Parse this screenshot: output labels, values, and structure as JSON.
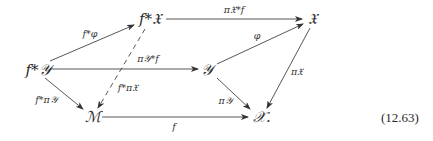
{
  "diagram": {
    "type": "commutative-diagram",
    "equation_number": "(12.63)",
    "nodes": [
      {
        "id": "fY",
        "label": "f*𝒴"
      },
      {
        "id": "fX",
        "label": "f*𝔛"
      },
      {
        "id": "X",
        "label": "𝔛"
      },
      {
        "id": "Y",
        "label": "𝒴"
      },
      {
        "id": "M",
        "label": "ℳ"
      },
      {
        "id": "Xbase",
        "label": "𝒳."
      }
    ],
    "edges": [
      {
        "from": "fY",
        "to": "fX",
        "label": "f*φ",
        "style": "solid"
      },
      {
        "from": "fX",
        "to": "X",
        "label": "π𝔛*f",
        "style": "solid"
      },
      {
        "from": "fY",
        "to": "Y",
        "label": "π𝒴*f",
        "style": "solid"
      },
      {
        "from": "Y",
        "to": "X",
        "label": "φ",
        "style": "solid"
      },
      {
        "from": "X",
        "to": "Xbase",
        "label": "π𝔛",
        "style": "solid"
      },
      {
        "from": "Y",
        "to": "Xbase",
        "label": "π𝒴",
        "style": "solid"
      },
      {
        "from": "fY",
        "to": "M",
        "label": "f*π𝒴",
        "style": "solid"
      },
      {
        "from": "fX",
        "to": "M",
        "label": "f*π𝔛",
        "style": "dashed"
      },
      {
        "from": "M",
        "to": "Xbase",
        "label": "f",
        "style": "solid"
      }
    ]
  }
}
